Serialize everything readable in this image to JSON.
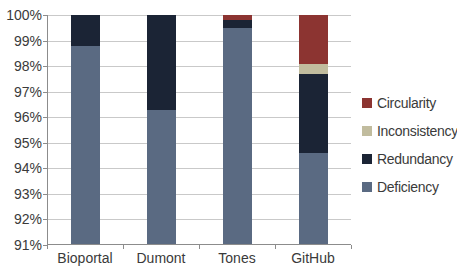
{
  "chart_data": {
    "type": "bar",
    "subtype": "stacked-100-column",
    "title": "",
    "xlabel": "",
    "ylabel": "",
    "categories": [
      "Bioportal",
      "Dumont",
      "Tones",
      "GitHub"
    ],
    "series": [
      {
        "name": "Deficiency",
        "color": "#5a6a82",
        "values": [
          98.8,
          96.3,
          99.5,
          94.6
        ]
      },
      {
        "name": "Redundancy",
        "color": "#1b2435",
        "values": [
          1.2,
          3.7,
          0.3,
          3.1
        ]
      },
      {
        "name": "Inconsistency",
        "color": "#c1bc9e",
        "values": [
          0,
          0,
          0,
          0.4
        ]
      },
      {
        "name": "Circularity",
        "color": "#8c3431",
        "values": [
          0,
          0,
          0.2,
          1.9
        ]
      }
    ],
    "legend": [
      "Circularity",
      "Inconsistency",
      "Redundancy",
      "Deficiency"
    ],
    "legend_position": "right",
    "y_ticks": [
      "100%",
      "99%",
      "98%",
      "97%",
      "96%",
      "95%",
      "94%",
      "93%",
      "92%",
      "91%"
    ],
    "ylim": [
      91,
      100
    ],
    "grid": true,
    "colors": {
      "gridline": "#c9c9c9",
      "axis": "#8c8c8c",
      "text": "#3a3a3a",
      "background": "#ffffff"
    }
  }
}
